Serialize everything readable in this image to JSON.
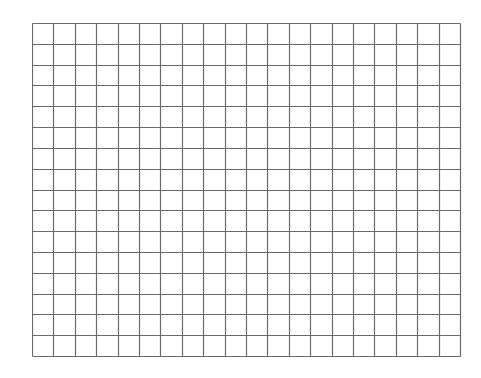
{
  "grid": {
    "columns": 20,
    "rows": 16,
    "width": 428,
    "height": 333,
    "line_color": "#6b6b6b",
    "background": "#ffffff"
  }
}
